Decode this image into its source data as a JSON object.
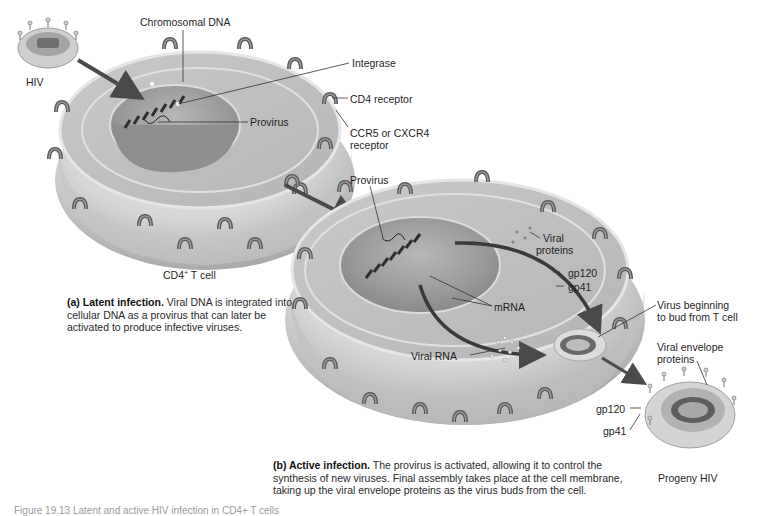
{
  "diagram": {
    "title_partial": "Figure 19.13 Latent and active HIV infection in CD4+ T cells",
    "panel_a": {
      "cell_label_prefix": "CD4",
      "cell_label_sup": "+",
      "cell_label_suffix": " T cell",
      "labels": {
        "hiv": "HIV",
        "chromosomal_dna": "Chromosomal DNA",
        "integrase": "Integrase",
        "provirus": "Provirus",
        "cd4_receptor": "CD4 receptor",
        "ccr5_line1": "CCR5 or CXCR4",
        "ccr5_line2": "receptor"
      },
      "caption_bold": "(a) Latent infection.",
      "caption_text": " Viral DNA is integrated into cellular DNA as a provirus that can later be activated to produce infective viruses."
    },
    "panel_b": {
      "labels": {
        "provirus": "Provirus",
        "viral_proteins_1": "Viral",
        "viral_proteins_2": "proteins",
        "gp120": "gp120",
        "gp41": "gp41",
        "mrna": "mRNA",
        "viral_rna": "Viral RNA",
        "bud_1": "Virus beginning",
        "bud_2": "to bud from T cell",
        "env_1": "Viral envelope",
        "env_2": "proteins",
        "progeny_gp120": "gp120",
        "progeny_gp41": "gp41",
        "progeny_hiv": "Progeny HIV"
      },
      "caption_bold": "(b) Active infection.",
      "caption_text": " The provirus is activated, allowing it to control the synthesis of new viruses. Final assembly takes place at the cell membrane, taking up the viral envelope proteins as the virus buds from the cell."
    },
    "colors": {
      "cell_surface": "#d9d9d9",
      "cell_shadow": "#9e9e9e",
      "nucleus": "#a8a8a8",
      "arrow": "#4a4a4a",
      "receptor": "#6e6e6e"
    }
  }
}
